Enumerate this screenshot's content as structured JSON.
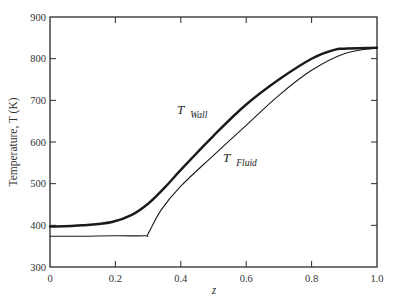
{
  "chart_data": {
    "type": "line",
    "title": "",
    "xlabel": "z",
    "ylabel": "Temperature, T (K)",
    "xlim": [
      0,
      1.0
    ],
    "ylim": [
      300,
      900
    ],
    "x_ticks": [
      "0",
      "0.2",
      "0.4",
      "0.6",
      "0.8",
      "1.0"
    ],
    "y_ticks": [
      "300",
      "400",
      "500",
      "600",
      "700",
      "800",
      "900"
    ],
    "grid": false,
    "legend": "inline labels",
    "series": [
      {
        "name": "T Wall",
        "label_main": "T",
        "label_sub": "Wall",
        "style": "thick",
        "x": [
          0,
          0.1,
          0.19,
          0.25,
          0.3,
          0.35,
          0.4,
          0.5,
          0.6,
          0.7,
          0.8,
          0.87,
          0.9,
          1.0
        ],
        "y": [
          397,
          400,
          408,
          425,
          452,
          490,
          533,
          615,
          690,
          750,
          800,
          821,
          824,
          826
        ]
      },
      {
        "name": "T Fluid",
        "label_main": "T",
        "label_sub": "Fluid",
        "style": "thin",
        "x": [
          0,
          0.1,
          0.2,
          0.29,
          0.3,
          0.34,
          0.4,
          0.5,
          0.6,
          0.7,
          0.8,
          0.9,
          1.0
        ],
        "y": [
          374,
          374,
          375,
          375,
          380,
          437,
          494,
          568,
          640,
          712,
          772,
          812,
          826
        ]
      }
    ]
  }
}
